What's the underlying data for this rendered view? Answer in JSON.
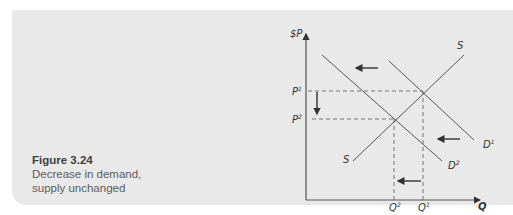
{
  "figure": {
    "number_label": "Figure 3.24",
    "caption_line1": "Decrease in demand,",
    "caption_line2": "supply unchanged"
  },
  "diagram": {
    "y_axis_label": "$P",
    "x_axis_label": "Q",
    "price_labels": [
      {
        "name": "P",
        "sup": "1"
      },
      {
        "name": "P",
        "sup": "2"
      }
    ],
    "quantity_labels": [
      {
        "name": "Q",
        "sup": "2"
      },
      {
        "name": "Q",
        "sup": "1"
      }
    ],
    "curves": {
      "supply_top": "S",
      "supply_bottom": "S",
      "demand1": {
        "name": "D",
        "sup": "1"
      },
      "demand2": {
        "name": "D",
        "sup": "2"
      }
    },
    "colors": {
      "line": "#555555",
      "panel": "#e9e9e9"
    }
  }
}
